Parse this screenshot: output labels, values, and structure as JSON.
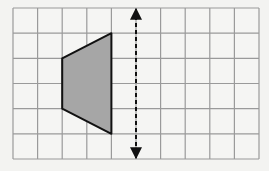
{
  "diagram": {
    "type": "grid-reflection",
    "grid": {
      "columns": 10,
      "rows": 6,
      "origin_px": [
        13,
        8
      ],
      "cell_w": 24.6,
      "cell_h": 25.17,
      "line_color": "#9a9a9a",
      "background": "#f5f5f3"
    },
    "shape": {
      "name": "trapezoid",
      "vertices_grid": [
        [
          2,
          2
        ],
        [
          4,
          1
        ],
        [
          4,
          5
        ],
        [
          2,
          4
        ]
      ],
      "fill": "#a6a6a6",
      "stroke": "#111111"
    },
    "mirror_line": {
      "orientation": "vertical",
      "grid_x": 5,
      "from_row": 0,
      "to_row": 6,
      "style": "dashed",
      "arrows": "both",
      "color": "#111111"
    }
  }
}
